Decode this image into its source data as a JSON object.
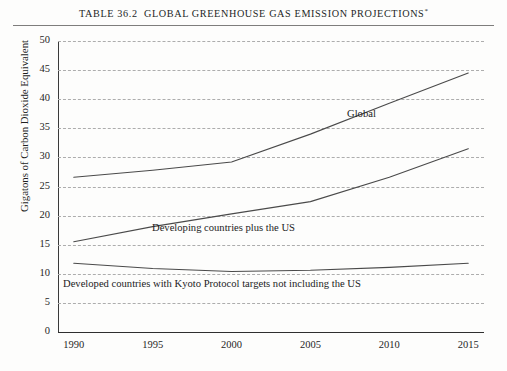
{
  "title": {
    "prefix": "TABLE 36.2",
    "text": "GLOBAL GREENHOUSE GAS EMISSION PROJECTIONS",
    "footnote_marker": "*",
    "full": "TABLE 36.2  GLOBAL GREENHOUSE GAS EMISSION PROJECTIONS"
  },
  "chart_data": {
    "type": "line",
    "xlabel": "",
    "ylabel": "Gigatons of Carbon Dioxide Equivalent",
    "x": [
      1990,
      1995,
      2000,
      2005,
      2010,
      2015
    ],
    "xtick_labels": [
      "1990",
      "1995",
      "2000",
      "2005",
      "2010",
      "2015"
    ],
    "ytick_labels": [
      "0",
      "5",
      "10",
      "15",
      "20",
      "25",
      "30",
      "35",
      "40",
      "45",
      "50"
    ],
    "yticks": [
      0,
      5,
      10,
      15,
      20,
      25,
      30,
      35,
      40,
      45,
      50
    ],
    "xlim": [
      1989,
      2016
    ],
    "ylim": [
      0,
      50
    ],
    "grid": "horizontal-dashed",
    "legend": "inline-annotations",
    "line_color": "#4a4a4a",
    "grid_color": "#adadad",
    "series": [
      {
        "name": "Global",
        "label": "Global",
        "values": [
          26.6,
          27.8,
          29.2,
          34.0,
          39.3,
          44.5
        ]
      },
      {
        "name": "Developing countries plus the US",
        "label": "Developing countries plus the US",
        "values": [
          15.5,
          18.1,
          20.3,
          22.4,
          26.6,
          31.5
        ]
      },
      {
        "name": "Developed countries with Kyoto Protocol targets not including the US",
        "label": "Developed countries with Kyoto Protocol targets not including the US",
        "values": [
          11.8,
          10.9,
          10.4,
          10.6,
          11.1,
          11.8
        ]
      }
    ],
    "annotations": [
      {
        "text": "Global",
        "x": 2011.0,
        "y": 38.5
      },
      {
        "text": "Developing countries plus the US",
        "x": 1999.0,
        "y": 18.4
      },
      {
        "text": "Developed countries with Kyoto Protocol targets not including the US",
        "x": 1990.4,
        "y": 8.9
      }
    ]
  }
}
